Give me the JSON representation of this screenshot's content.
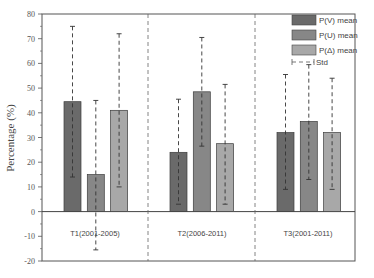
{
  "chart_data": {
    "type": "bar",
    "title": "",
    "xlabel": "",
    "ylabel": "Percentage (%)",
    "ylim": [
      -20,
      80
    ],
    "yticks": [
      -20,
      -10,
      0,
      10,
      20,
      30,
      40,
      50,
      60,
      70,
      80
    ],
    "grid": false,
    "legend_position": "upper right",
    "categories": [
      "T1(2001-2005)",
      "T2(2006-2011)",
      "T3(2001-2011)"
    ],
    "series": [
      {
        "name": "P(V) mean",
        "color": "#6a6a6a",
        "values": [
          44.5,
          24,
          32
        ],
        "std_upper": [
          75,
          45.5,
          55.5
        ],
        "std_lower": [
          14,
          3,
          9
        ]
      },
      {
        "name": "P(U) mean",
        "color": "#878787",
        "values": [
          15,
          48.5,
          36.5
        ],
        "std_upper": [
          45,
          70.5,
          59.5
        ],
        "std_lower": [
          -15.5,
          26.5,
          13
        ]
      },
      {
        "name": "P(Δ) mean",
        "color": "#a8a8a8",
        "values": [
          41,
          27.5,
          32
        ],
        "std_upper": [
          72,
          51.5,
          54
        ],
        "std_lower": [
          10,
          3,
          9
        ]
      }
    ],
    "error_bar_label": "Std"
  },
  "axis": {
    "ylabel": "Percentage (%)",
    "ytick_labels": [
      "-20",
      "-10",
      "0",
      "10",
      "20",
      "30",
      "40",
      "50",
      "60",
      "70",
      "80"
    ]
  },
  "categories": {
    "t1": "T1(2001-2005)",
    "t2": "T2(2006-2011)",
    "t3": "T3(2001-2011)"
  },
  "legend": {
    "v": "P(V) mean",
    "u": "P(U) mean",
    "d": "P(Δ) mean",
    "std": "Std"
  }
}
